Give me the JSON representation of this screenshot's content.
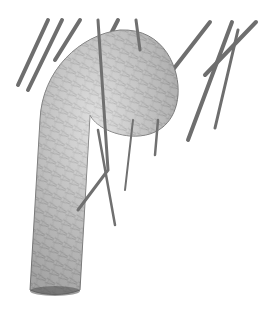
{
  "image": {
    "subject": "Illustration of a woven hanging bird nest with a long tubular entrance, suspended among palm fronds",
    "alt": "Pencil illustration of a woven weaver-bird nest hanging from palm leaves",
    "colors": {
      "background": "#ffffff",
      "nest_fill": "#c9c9c9",
      "nest_shadow": "#8a8a8a",
      "nest_light": "#e8e8e8",
      "frond": "#6e6e6e",
      "weave_line": "#9a9a9a"
    }
  }
}
